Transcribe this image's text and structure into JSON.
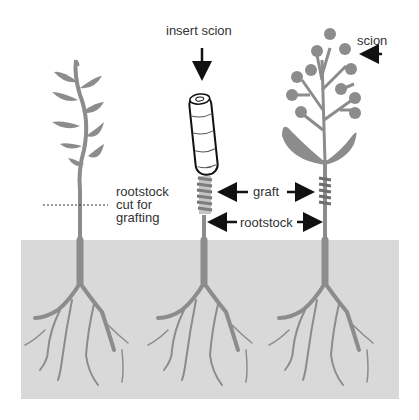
{
  "labels": {
    "insert_scion": "insert scion",
    "scion": "scion",
    "rootstock_cut_line1": "rootstock",
    "rootstock_cut_line2": "cut for",
    "rootstock_cut_line3": "grafting",
    "graft": "graft",
    "rootstock": "rootstock"
  },
  "colors": {
    "plant": "#8c8c8c",
    "soil": "#d9d9d9",
    "text": "#333333",
    "arrow": "#111111",
    "graft_wrap": "#6e6e6e"
  },
  "stages": [
    {
      "name": "rootstock-before-cut"
    },
    {
      "name": "scion-insertion"
    },
    {
      "name": "grafted-plant"
    }
  ]
}
